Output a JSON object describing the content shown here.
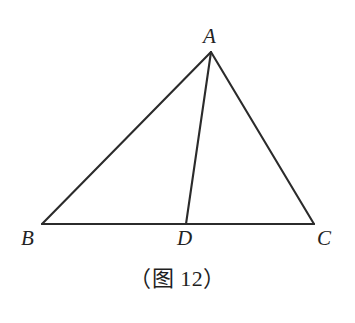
{
  "figure": {
    "caption": "（图 12）",
    "background_color": "#ffffff",
    "stroke_color": "#2b2b2b",
    "stroke_width": 2.1,
    "width": 355,
    "height": 323,
    "points": {
      "A": {
        "label": "A",
        "x": 211,
        "y": 52
      },
      "B": {
        "label": "B",
        "x": 42,
        "y": 224
      },
      "C": {
        "label": "C",
        "x": 314,
        "y": 224
      },
      "D": {
        "label": "D",
        "x": 186,
        "y": 224
      }
    },
    "segments": [
      {
        "name": "AB",
        "from": "A",
        "to": "B"
      },
      {
        "name": "BC",
        "from": "B",
        "to": "C"
      },
      {
        "name": "CA",
        "from": "C",
        "to": "A"
      },
      {
        "name": "AD",
        "from": "A",
        "to": "D"
      }
    ],
    "labels": {
      "A": "A",
      "B": "B",
      "C": "C",
      "D": "D"
    }
  }
}
